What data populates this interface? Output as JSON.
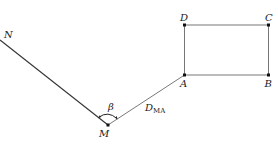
{
  "diagram": {
    "type": "surveying-traverse",
    "points": {
      "N": {
        "label": "N",
        "x": 0,
        "y": 40
      },
      "M": {
        "label": "M",
        "x": 108,
        "y": 125
      },
      "A": {
        "label": "A",
        "x": 184.5,
        "y": 75
      },
      "B": {
        "label": "B",
        "x": 268.5,
        "y": 75
      },
      "C": {
        "label": "C",
        "x": 268.5,
        "y": 25
      },
      "D": {
        "label": "D",
        "x": 184.5,
        "y": 25
      }
    },
    "angle_label": "β",
    "distance_label": {
      "main": "D",
      "subscript": "MA"
    },
    "colors": {
      "line": "#333333",
      "thin_line": "#555555",
      "point": "#111111",
      "text": "#222222"
    }
  }
}
